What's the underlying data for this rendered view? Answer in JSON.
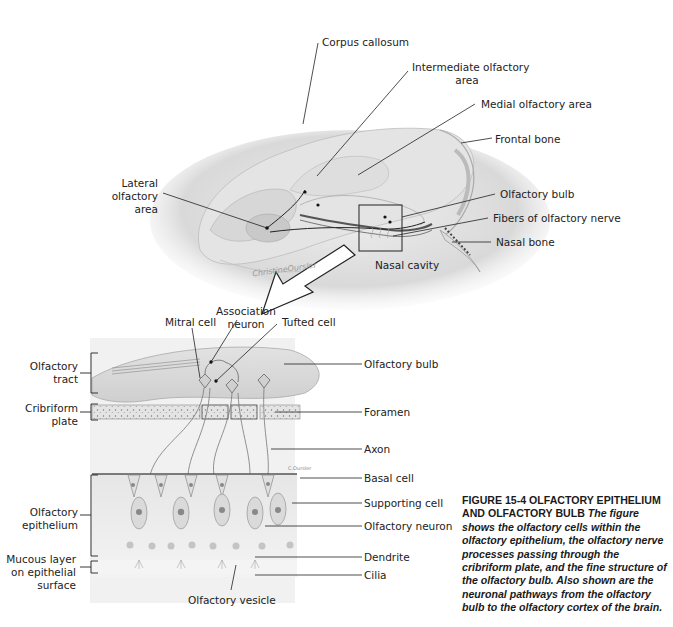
{
  "figure": {
    "title": "FIGURE 15-4 OLFACTORY EPITHELIUM AND OLFACTORY BULB",
    "caption": "The figure shows the olfactory cells within the olfactory epithelium, the olfactory nerve processes passing through the cribriform plate, and the fine structure of the olfactory bulb. Also shown are the neuronal pathways from the olfactory bulb to the olfactory cortex of the brain.",
    "artist_signature": "ChristineOursler"
  },
  "top_panel": {
    "labels": {
      "corpus_callosum": "Corpus callosum",
      "intermediate_olfactory_area_l1": "Intermediate olfactory",
      "intermediate_olfactory_area_l2": "area",
      "medial_olfactory_area": "Medial olfactory area",
      "frontal_bone": "Frontal bone",
      "lateral_olfactory_area_l1": "Lateral",
      "lateral_olfactory_area_l2": "olfactory",
      "lateral_olfactory_area_l3": "area",
      "olfactory_bulb": "Olfactory bulb",
      "fibers_of_olfactory_nerve": "Fibers of olfactory nerve",
      "nasal_bone": "Nasal bone",
      "nasal_cavity": "Nasal cavity"
    }
  },
  "bottom_panel": {
    "top_labels": {
      "mitral_cell": "Mitral cell",
      "association_neuron_l1": "Association",
      "association_neuron_l2": "neuron",
      "tufted_cell": "Tufted cell"
    },
    "left_labels": {
      "olfactory_tract_l1": "Olfactory",
      "olfactory_tract_l2": "tract",
      "cribriform_plate_l1": "Cribriform",
      "cribriform_plate_l2": "plate",
      "olfactory_epithelium_l1": "Olfactory",
      "olfactory_epithelium_l2": "epithelium",
      "mucous_layer_l1": "Mucous layer",
      "mucous_layer_l2": "on epithelial",
      "mucous_layer_l3": "surface"
    },
    "right_labels": {
      "olfactory_bulb": "Olfactory bulb",
      "foramen": "Foramen",
      "axon": "Axon",
      "basal_cell": "Basal cell",
      "supporting_cell": "Supporting cell",
      "olfactory_neuron": "Olfactory neuron",
      "dendrite": "Dendrite",
      "cilia": "Cilia"
    },
    "bottom_labels": {
      "olfactory_vesicle": "Olfactory vesicle"
    }
  }
}
